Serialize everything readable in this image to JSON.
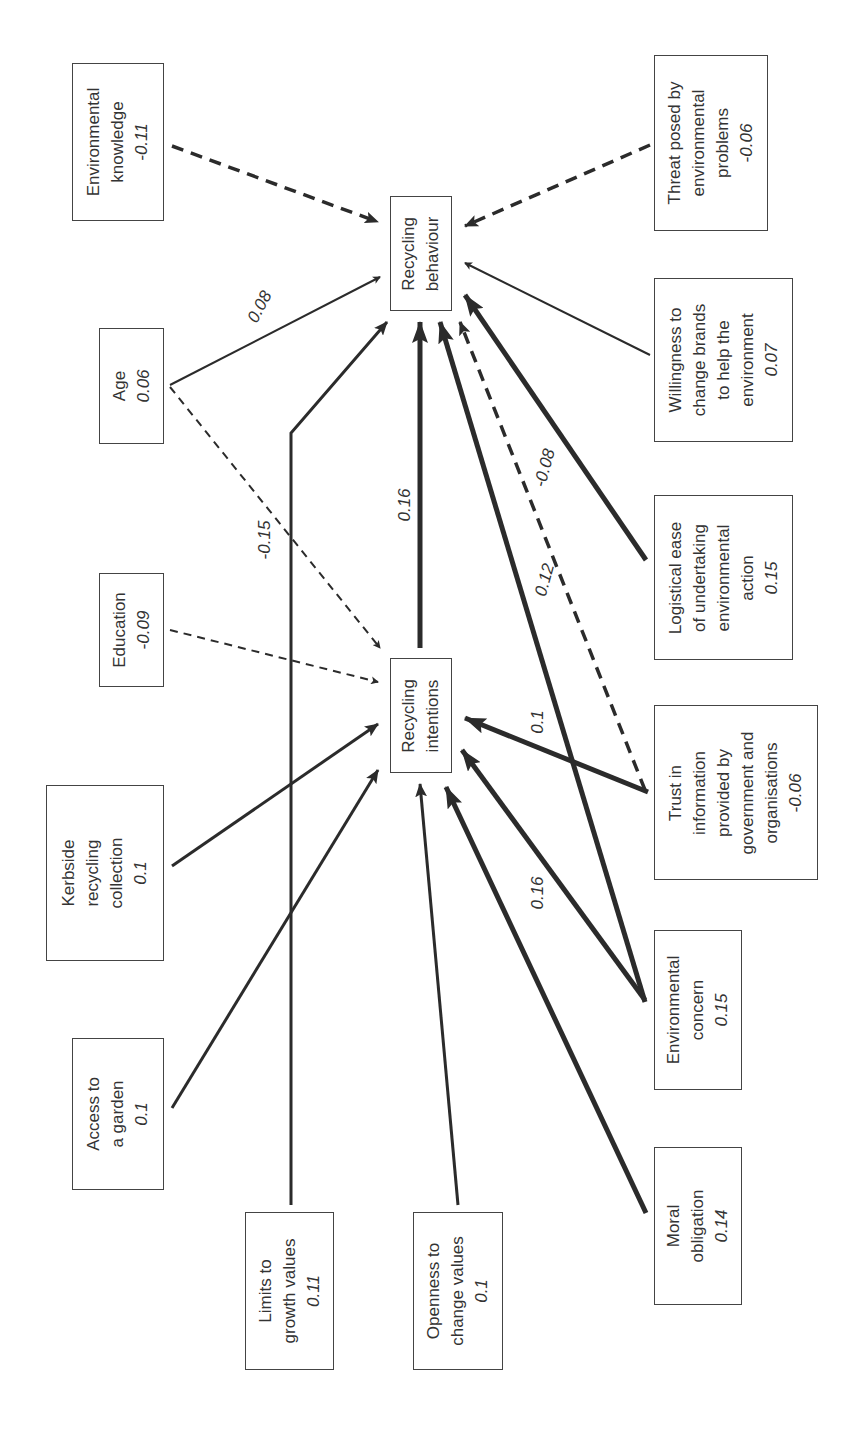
{
  "diagram": {
    "title": "",
    "orientation": "rotated-90-ccw",
    "nodes": {
      "env_knowledge": {
        "label": [
          "Environmental",
          "knowledge"
        ],
        "value": "-0.11"
      },
      "threat": {
        "label": [
          "Threat posed by",
          "environmental",
          "problems"
        ],
        "value": "-0.06"
      },
      "recycling_behaviour": {
        "label": [
          "Recycling",
          "behaviour"
        ],
        "value": ""
      },
      "age": {
        "label": [
          "Age"
        ],
        "value": "0.06"
      },
      "willingness": {
        "label": [
          "Willingness to",
          "change brands",
          "to help the",
          "environment"
        ],
        "value": "0.07"
      },
      "education": {
        "label": [
          "Education"
        ],
        "value": "-0.09"
      },
      "logistical": {
        "label": [
          "Logistical ease",
          "of undertaking",
          "environmental",
          "action"
        ],
        "value": "0.15"
      },
      "recycling_intentions": {
        "label": [
          "Recycling",
          "intentions"
        ],
        "value": ""
      },
      "trust": {
        "label": [
          "Trust in",
          "information",
          "provided by",
          "government and",
          "organisations"
        ],
        "value": "-0.06"
      },
      "kerbside": {
        "label": [
          "Kerbside",
          "recycling",
          "collection"
        ],
        "value": "0.1"
      },
      "env_concern": {
        "label": [
          "Environmental",
          "concern"
        ],
        "value": "0.15"
      },
      "garden": {
        "label": [
          "Access to",
          "a garden"
        ],
        "value": "0.1"
      },
      "moral": {
        "label": [
          "Moral",
          "obligation"
        ],
        "value": "0.14"
      },
      "limits": {
        "label": [
          "Limits to",
          "growth values"
        ],
        "value": "0.11"
      },
      "openness": {
        "label": [
          "Openness to",
          "change values"
        ],
        "value": "0.1"
      }
    },
    "edge_labels": {
      "age_behaviour": "0.08",
      "age_intentions": "-0.15",
      "intentions_behaviour": "0.16",
      "concern_behaviour": "0.12",
      "trust_behaviour": "-0.08",
      "trust_intentions": "0.1",
      "moral_intentions": "0.16"
    },
    "edges": [
      {
        "from": "env_knowledge",
        "to": "recycling_behaviour",
        "style": "dashed-thick"
      },
      {
        "from": "threat",
        "to": "recycling_behaviour",
        "style": "dashed-thick"
      },
      {
        "from": "age",
        "to": "recycling_behaviour",
        "style": "solid-thin",
        "label": "0.08"
      },
      {
        "from": "age",
        "to": "recycling_intentions",
        "style": "dashed-thin",
        "label": "-0.15"
      },
      {
        "from": "willingness",
        "to": "recycling_behaviour",
        "style": "solid-thin"
      },
      {
        "from": "logistical",
        "to": "recycling_behaviour",
        "style": "solid-thick"
      },
      {
        "from": "limits",
        "to": "recycling_behaviour",
        "style": "solid-medium"
      },
      {
        "from": "recycling_intentions",
        "to": "recycling_behaviour",
        "style": "solid-thick",
        "label": "0.16"
      },
      {
        "from": "env_concern",
        "to": "recycling_behaviour",
        "style": "solid-thick",
        "label": "0.12"
      },
      {
        "from": "trust",
        "to": "recycling_behaviour",
        "style": "dashed-medium",
        "label": "-0.08"
      },
      {
        "from": "education",
        "to": "recycling_intentions",
        "style": "dashed-thin"
      },
      {
        "from": "kerbside",
        "to": "recycling_intentions",
        "style": "solid-medium"
      },
      {
        "from": "garden",
        "to": "recycling_intentions",
        "style": "solid-medium"
      },
      {
        "from": "openness",
        "to": "recycling_intentions",
        "style": "solid-medium"
      },
      {
        "from": "moral",
        "to": "recycling_intentions",
        "style": "solid-thick",
        "label": "0.16"
      },
      {
        "from": "env_concern",
        "to": "recycling_intentions",
        "style": "solid-thick"
      },
      {
        "from": "trust",
        "to": "recycling_intentions",
        "style": "solid-thick",
        "label": "0.1"
      }
    ]
  },
  "colors": {
    "line": "#2b2b2b",
    "box_border": "#444444",
    "text": "#333333",
    "background": "#ffffff"
  }
}
